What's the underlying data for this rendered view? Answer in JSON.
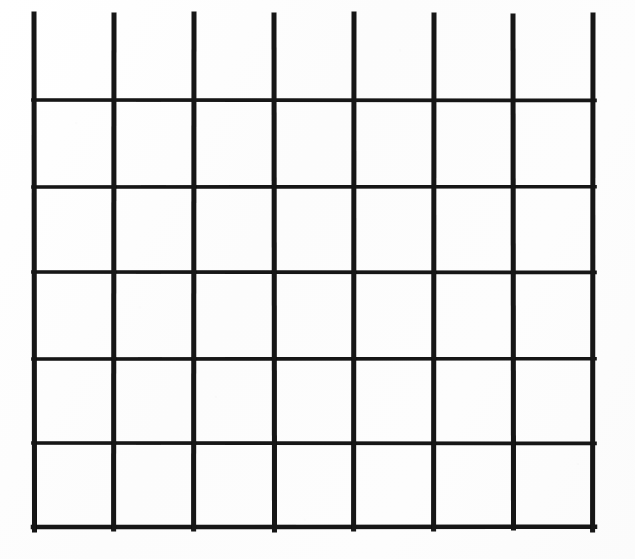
{
  "image": {
    "kind": "scanned-hand-drawn-grid",
    "width": 635,
    "height": 559,
    "background_color": "#fdfdfd",
    "ink_color": "#111111"
  },
  "grid": {
    "columns": 7,
    "rows": 6,
    "has_top_border": false,
    "has_bottom_border": true,
    "has_left_border": true,
    "has_right_border": true,
    "vertical_line_count": 8,
    "horizontal_line_count": 6,
    "vertical_line_thickness": 5,
    "horizontal_line_thickness": 3.6,
    "vertical_x": [
      34,
      114,
      194,
      274,
      354,
      434,
      513,
      593
    ],
    "vertical_top_y": [
      14,
      15,
      14,
      15,
      14,
      15,
      16,
      15
    ],
    "vertical_bottom_y": [
      530,
      529,
      529,
      530,
      529,
      529,
      528,
      530
    ],
    "horizontal_y": [
      100,
      187,
      272,
      359,
      443,
      527
    ],
    "horizontal_x_start": 33,
    "horizontal_x_end": 595,
    "column_widths": [
      80,
      80,
      80,
      80,
      80,
      79,
      80
    ],
    "row_heights": [
      86,
      87,
      85,
      87,
      84,
      84
    ],
    "open_row_top_extent": 14
  },
  "chart_data": {
    "type": "table",
    "title": "",
    "columns": 7,
    "rows": 6,
    "column_headers": [
      "",
      "",
      "",
      "",
      "",
      "",
      ""
    ],
    "cells": [
      [
        "",
        "",
        "",
        "",
        "",
        "",
        ""
      ],
      [
        "",
        "",
        "",
        "",
        "",
        "",
        ""
      ],
      [
        "",
        "",
        "",
        "",
        "",
        "",
        ""
      ],
      [
        "",
        "",
        "",
        "",
        "",
        "",
        ""
      ],
      [
        "",
        "",
        "",
        "",
        "",
        "",
        ""
      ],
      [
        "",
        "",
        "",
        "",
        "",
        "",
        ""
      ]
    ]
  }
}
